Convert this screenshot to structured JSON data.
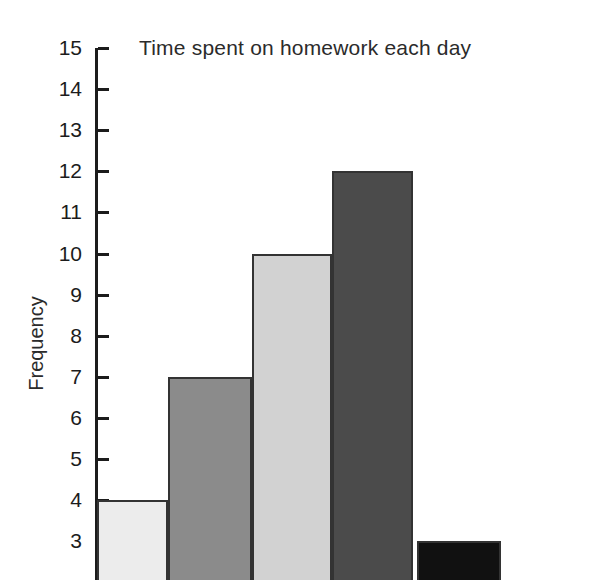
{
  "chart_data": {
    "type": "bar",
    "title": "Time spent on homework each day",
    "xlabel": "",
    "ylabel": "Frequency",
    "ylim": [
      3,
      15
    ],
    "grid": false,
    "legend": null,
    "note": "Image is cropped at the bottom; x-axis category labels and the region below frequency 3 are not visible.",
    "categories": [
      "1",
      "2",
      "3",
      "4",
      "5"
    ],
    "values": [
      4,
      7,
      10,
      12,
      3
    ],
    "tick_labels": [
      "15",
      "14",
      "13",
      "12",
      "11",
      "10",
      "9",
      "8",
      "7",
      "6",
      "5",
      "4",
      "3"
    ],
    "tick_values": [
      15,
      14,
      13,
      12,
      11,
      10,
      9,
      8,
      7,
      6,
      5,
      4,
      3
    ],
    "bars": [
      {
        "name": "bar-1",
        "value": 4,
        "color": "#ececec",
        "x": 0,
        "width": 71
      },
      {
        "name": "bar-2",
        "value": 7,
        "color": "#8b8b8b",
        "x": 71,
        "width": 84
      },
      {
        "name": "bar-3",
        "value": 10,
        "color": "#d2d2d2",
        "x": 155,
        "width": 80
      },
      {
        "name": "bar-4",
        "value": 12,
        "color": "#4b4b4b",
        "x": 235,
        "width": 81
      },
      {
        "name": "bar-5",
        "value": 3,
        "color": "#111111",
        "x": 320,
        "width": 84
      }
    ],
    "colors": {
      "axis": "#1c1c1c",
      "text": "#2b2b2b",
      "background": "#ffffff",
      "bar_outline": "#333333"
    }
  }
}
